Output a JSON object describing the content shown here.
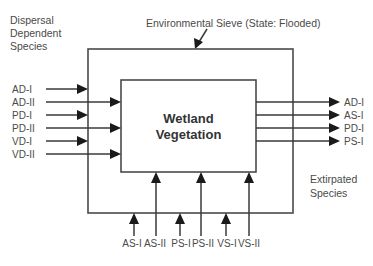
{
  "diagram": {
    "header_left": [
      "Dispersal",
      "Dependent",
      "Species"
    ],
    "sieve_label": "Environmental Sieve (State: Flooded)",
    "center": [
      "Wetland",
      "Vegetation"
    ],
    "footer_right": [
      "Extirpated",
      "Species"
    ],
    "left_inputs": [
      {
        "label": "AD-I",
        "reaches": "sieve"
      },
      {
        "label": "AD-II",
        "reaches": "vegetation"
      },
      {
        "label": "PD-I",
        "reaches": "sieve"
      },
      {
        "label": "PD-II",
        "reaches": "vegetation"
      },
      {
        "label": "VD-I",
        "reaches": "sieve"
      },
      {
        "label": "VD-II",
        "reaches": "vegetation"
      }
    ],
    "bottom_inputs": [
      {
        "label": "AS-I",
        "reaches": "sieve"
      },
      {
        "label": "AS-II",
        "reaches": "vegetation"
      },
      {
        "label": "PS-I",
        "reaches": "sieve"
      },
      {
        "label": "PS-II",
        "reaches": "vegetation"
      },
      {
        "label": "VS-I",
        "reaches": "sieve"
      },
      {
        "label": "VS-II",
        "reaches": "vegetation"
      }
    ],
    "right_outputs": [
      {
        "label": "AD-I"
      },
      {
        "label": "AS-I"
      },
      {
        "label": "PD-I"
      },
      {
        "label": "PS-I"
      }
    ]
  }
}
